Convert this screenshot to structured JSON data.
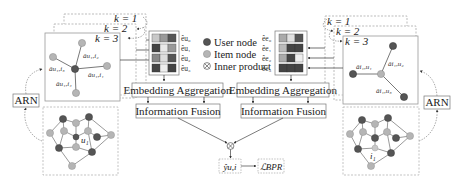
{
  "colors": {
    "user_node": "#555555",
    "item_node": "#b5b5b5",
    "border": "#888888",
    "dashed_border": "#aaaaaa",
    "text": "#222222"
  },
  "legend": {
    "user_node": "User node",
    "item_node": "Item node",
    "inner_product": "Inner product"
  },
  "left_branch": {
    "layers": [
      "k = 1",
      "k = 2",
      "k = 3"
    ],
    "arn_label": "ARN",
    "edge_labels": [
      "âu₁,i₂",
      "âu₁,i₃",
      "âu₁,i₁",
      "âu₁,i₄"
    ],
    "embedding_labels": [
      "êu₀",
      "êu₁",
      "êu₂",
      "êu₃"
    ],
    "graph_label": "u₁",
    "aggregation_label": "Embedding Aggregation",
    "fusion_label": "Information Fusion"
  },
  "right_branch": {
    "layers": [
      "k = 1",
      "k = 2",
      "k = 3"
    ],
    "arn_label": "ARN",
    "edge_labels": [
      "âi₁,u₂",
      "âi₁,u₁",
      "âi₁,u₃"
    ],
    "embedding_labels": [
      "êe₀",
      "êe₁",
      "êe₂",
      "êe₃"
    ],
    "graph_label": "i₁",
    "aggregation_label": "Embedding Aggregation",
    "fusion_label": "Information Fusion"
  },
  "output": {
    "prediction": "ŷu,i",
    "loss": "ℒBPR"
  }
}
